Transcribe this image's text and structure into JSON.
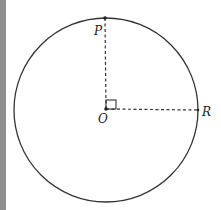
{
  "figure": {
    "type": "circle-geometry",
    "circle": {
      "center": [
        106,
        110
      ],
      "radius": 92,
      "stroke": "#333333"
    },
    "points": [
      {
        "name": "P",
        "label": "P",
        "pos": [
          105,
          18
        ]
      },
      {
        "name": "O",
        "label": "O",
        "pos": [
          106,
          110
        ]
      },
      {
        "name": "R",
        "label": "R",
        "pos": [
          198,
          110
        ]
      }
    ],
    "segments": [
      {
        "from": "O",
        "to": "P",
        "style": "dashed"
      },
      {
        "from": "O",
        "to": "R",
        "style": "dashed"
      }
    ],
    "right_angle_at": "O"
  },
  "labels": {
    "P": "P",
    "O": "O",
    "R": "R"
  }
}
